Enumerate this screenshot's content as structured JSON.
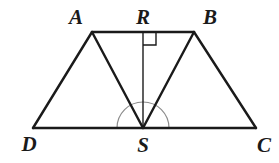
{
  "figure": {
    "background_color": "#ffffff",
    "stroke_color": "#1a1a1a",
    "mark_color": "#8c8c8c",
    "width": 279,
    "height": 163
  },
  "points": {
    "A": {
      "label": "A",
      "x": 92,
      "y": 32,
      "label_x": 76,
      "label_y": 24
    },
    "R": {
      "label": "R",
      "x": 143,
      "y": 32,
      "label_x": 143,
      "label_y": 24
    },
    "B": {
      "label": "B",
      "x": 194,
      "y": 32,
      "label_x": 210,
      "label_y": 24
    },
    "D": {
      "label": "D",
      "x": 33,
      "y": 128,
      "label_x": 29,
      "label_y": 151
    },
    "S": {
      "label": "S",
      "x": 143,
      "y": 128,
      "label_x": 143,
      "label_y": 152
    },
    "C": {
      "label": "C",
      "x": 256,
      "y": 128,
      "label_x": 264,
      "label_y": 152
    }
  },
  "segments": [
    {
      "name": "segment-AB",
      "from": "A",
      "to": "B"
    },
    {
      "name": "segment-AD",
      "from": "A",
      "to": "D"
    },
    {
      "name": "segment-BC",
      "from": "B",
      "to": "C"
    },
    {
      "name": "segment-DC",
      "from": "D",
      "to": "C"
    },
    {
      "name": "segment-AS",
      "from": "A",
      "to": "S"
    },
    {
      "name": "segment-BS",
      "from": "B",
      "to": "S"
    },
    {
      "name": "segment-RS",
      "from": "R",
      "to": "S"
    }
  ],
  "marks": {
    "right_angle": {
      "name": "right-angle-mark-at-R",
      "vertex": "R",
      "size": 13,
      "description": "square mark indicating RS is perpendicular to AB"
    },
    "angle_arcs": [
      {
        "name": "angle-arc-ASR",
        "vertex": "S",
        "radius": 26
      },
      {
        "name": "angle-arc-RSB",
        "vertex": "S",
        "radius": 26
      }
    ]
  }
}
